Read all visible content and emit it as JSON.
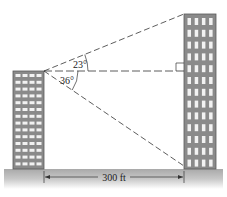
{
  "diagram": {
    "type": "trigonometry-two-buildings",
    "angles": {
      "elevation": {
        "label": "23°",
        "value": 23
      },
      "depression": {
        "label": "36°",
        "value": 36
      }
    },
    "distance": {
      "label": "300 ft",
      "value": 300,
      "unit": "ft"
    },
    "left_building": {
      "window_columns": 4,
      "window_rows": 14
    },
    "right_building": {
      "window_columns": 4,
      "window_rows": 13
    },
    "right_angle_marker": true,
    "colors": {
      "building_fill": "#8a8a8a",
      "building_edge": "#5a5a5a",
      "window": "#f2f2f2",
      "ground": "#b5b5b5",
      "dash_line": "#333333"
    }
  }
}
